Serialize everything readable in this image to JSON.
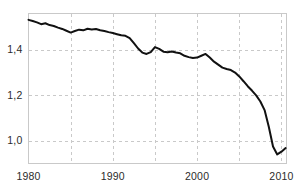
{
  "chart_data": {
    "type": "line",
    "title": "",
    "subtitle": "",
    "xlabel": "",
    "ylabel": "",
    "xlim": [
      1980,
      2010.6
    ],
    "ylim": [
      0.9,
      1.56
    ],
    "grid": true,
    "legend": null,
    "legend_position": "none",
    "x_ticks": [
      1980,
      1990,
      2000,
      2010
    ],
    "x_tick_labels": [
      "1980",
      "1990",
      "2000",
      "2010"
    ],
    "x_minor_gridlines": [
      1985,
      1995,
      2005
    ],
    "y_ticks": [
      1.0,
      1.2,
      1.4
    ],
    "y_tick_labels": [
      "1,0",
      "1,2",
      "1,4"
    ],
    "decimal_separator": ",",
    "line_color": "#111111",
    "line_width": 2,
    "grid_color": "#c9c9c9",
    "frame_color": "#c9c9c9",
    "background_color": "#ffffff",
    "series": [
      {
        "name": "series-1",
        "x": [
          1980.0,
          1980.5,
          1981.0,
          1981.5,
          1982.0,
          1982.5,
          1983.0,
          1983.5,
          1984.0,
          1984.5,
          1985.0,
          1985.5,
          1986.0,
          1986.5,
          1987.0,
          1987.5,
          1988.0,
          1988.5,
          1989.0,
          1989.5,
          1990.0,
          1990.5,
          1991.0,
          1991.5,
          1992.0,
          1992.5,
          1993.0,
          1993.5,
          1994.0,
          1994.5,
          1995.0,
          1995.5,
          1996.0,
          1996.5,
          1997.0,
          1997.5,
          1998.0,
          1998.5,
          1999.0,
          1999.5,
          2000.0,
          2000.5,
          2001.0,
          2001.5,
          2002.0,
          2002.5,
          2003.0,
          2003.5,
          2004.0,
          2004.5,
          2005.0,
          2005.5,
          2006.0,
          2006.5,
          2007.0,
          2007.5,
          2008.0,
          2008.5,
          2009.0,
          2009.5,
          2010.0,
          2010.5
        ],
        "y": [
          1.532,
          1.527,
          1.521,
          1.513,
          1.517,
          1.509,
          1.505,
          1.498,
          1.492,
          1.484,
          1.476,
          1.483,
          1.489,
          1.486,
          1.493,
          1.49,
          1.492,
          1.486,
          1.483,
          1.478,
          1.474,
          1.469,
          1.464,
          1.462,
          1.452,
          1.43,
          1.406,
          1.388,
          1.382,
          1.39,
          1.412,
          1.404,
          1.392,
          1.39,
          1.393,
          1.388,
          1.385,
          1.374,
          1.368,
          1.364,
          1.366,
          1.374,
          1.382,
          1.366,
          1.348,
          1.335,
          1.322,
          1.316,
          1.311,
          1.3,
          1.283,
          1.262,
          1.24,
          1.221,
          1.2,
          1.173,
          1.135,
          1.062,
          0.975,
          0.94,
          0.952,
          0.968
        ]
      }
    ]
  },
  "axes": {
    "y_labels": [
      "1,4",
      "1,2",
      "1,0"
    ],
    "x_labels": [
      "1980",
      "1990",
      "2000",
      "2010"
    ]
  }
}
